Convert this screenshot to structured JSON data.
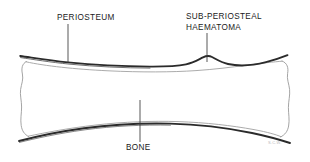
{
  "figure": {
    "background_color": "#ffffff",
    "ink_color": "#262626",
    "thin_line_color": "#8f8f8f",
    "label_color": "#1a1a1a",
    "signature": "S.C.W."
  },
  "labels": {
    "periosteum": "PERIOSTEUM",
    "haematoma_line1": "SUB-PERIOSTEAL",
    "haematoma_line2": "HAEMATOMA",
    "bone": "BONE"
  },
  "leader_lines": [
    {
      "name": "periosteum-leader",
      "x": 68,
      "y_top": 24,
      "y_bottom": 63
    },
    {
      "name": "haematoma-leader",
      "x": 207,
      "y_top": 33,
      "y_bottom": 62
    },
    {
      "name": "bone-leader",
      "x": 140,
      "y_top": 100,
      "y_bottom": 142
    }
  ],
  "structures": [
    {
      "name": "periosteum",
      "description": "thick dark outer membrane line following the bone contour"
    },
    {
      "name": "sub-periosteal-haematoma",
      "description": "raised lens-shaped bump where periosteum is lifted off the bone near x=205"
    },
    {
      "name": "bone-cortex",
      "description": "thin inner outline of the long bone shaft with flared ends"
    }
  ]
}
